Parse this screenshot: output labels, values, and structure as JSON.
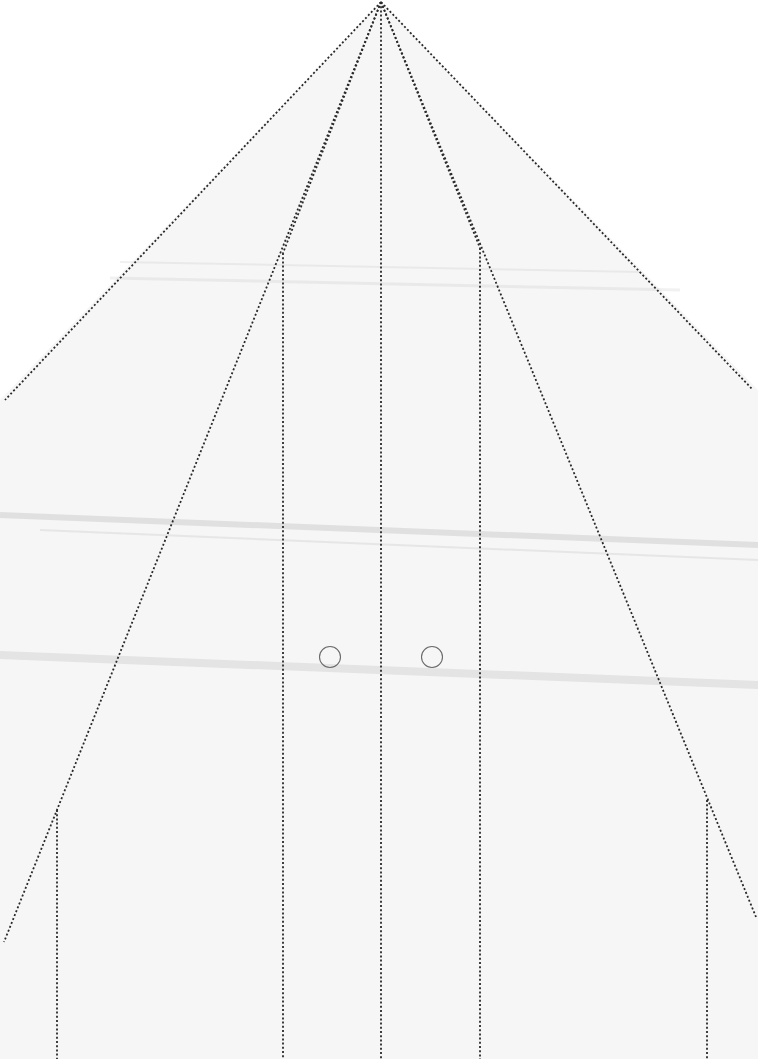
{
  "document": {
    "type": "paper-folding-template",
    "colors": {
      "background": "#ffffff",
      "paper": "#f6f6f6",
      "fold_line": "#2a2a2a",
      "circle": "#6a6a6a",
      "scan_shadow": "#e4e4e4"
    },
    "apex": [
      381,
      2
    ],
    "outer_diagonals": [
      {
        "id": "outer-left",
        "from": [
          381,
          2
        ],
        "to": [
          5,
          400
        ]
      },
      {
        "id": "outer-right",
        "from": [
          381,
          2
        ],
        "to": [
          753,
          390
        ]
      }
    ],
    "inner_diagonals": [
      {
        "id": "inner-left",
        "from": [
          381,
          2
        ],
        "to": [
          4,
          942
        ]
      },
      {
        "id": "inner-right",
        "from": [
          381,
          2
        ],
        "to": [
          756,
          917
        ]
      }
    ],
    "mid_diagonals": [
      {
        "id": "mid-left",
        "from": [
          381,
          2
        ],
        "to": [
          283,
          253
        ]
      },
      {
        "id": "mid-right",
        "from": [
          381,
          2
        ],
        "to": [
          480,
          248
        ]
      }
    ],
    "vertical_lines": [
      {
        "id": "v-outer-left",
        "x": 57,
        "y_start": 810,
        "y_end": 1059
      },
      {
        "id": "v-inner-left",
        "x": 283,
        "y_start": 253,
        "y_end": 1059
      },
      {
        "id": "v-center",
        "x": 381,
        "y_start": 2,
        "y_end": 1059
      },
      {
        "id": "v-inner-right",
        "x": 480,
        "y_start": 248,
        "y_end": 1059
      },
      {
        "id": "v-outer-right",
        "x": 707,
        "y_start": 800,
        "y_end": 1059
      }
    ],
    "circles": [
      {
        "id": "circle-left",
        "cx": 330,
        "cy": 657,
        "r": 10.5
      },
      {
        "id": "circle-right",
        "cx": 432,
        "cy": 657,
        "r": 10.5
      }
    ],
    "scan_shadows": [
      {
        "from": [
          0,
          515
        ],
        "to": [
          758,
          545
        ],
        "width": 6,
        "opacity": 0.35
      },
      {
        "from": [
          40,
          530
        ],
        "to": [
          758,
          560
        ],
        "width": 2,
        "opacity": 0.25
      },
      {
        "from": [
          0,
          655
        ],
        "to": [
          758,
          685
        ],
        "width": 8,
        "opacity": 0.3
      },
      {
        "from": [
          120,
          262
        ],
        "to": [
          640,
          272
        ],
        "width": 2,
        "opacity": 0.2
      },
      {
        "from": [
          110,
          278
        ],
        "to": [
          680,
          290
        ],
        "width": 3,
        "opacity": 0.2
      }
    ]
  }
}
